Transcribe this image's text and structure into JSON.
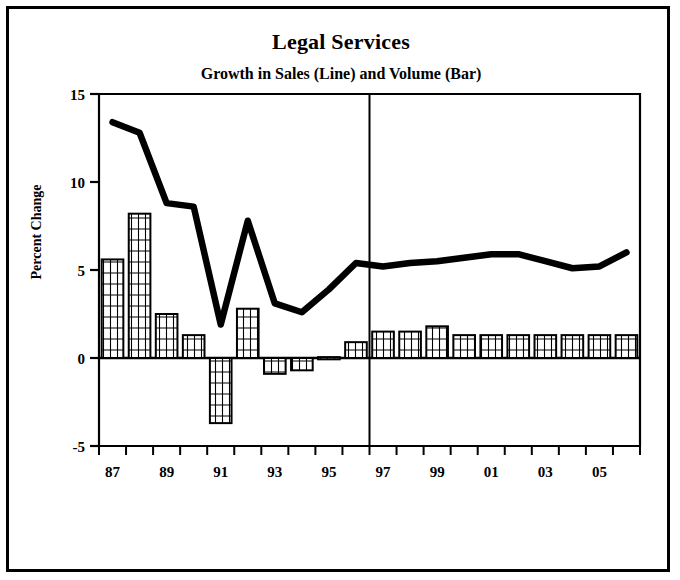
{
  "chart_data": {
    "type": "bar",
    "title": "Legal Services",
    "subtitle": "Growth in Sales (Line) and Volume (Bar)",
    "xlabel": "",
    "ylabel": "Percent Change",
    "ylim": [
      -5,
      15
    ],
    "yticks": [
      -5,
      0,
      5,
      10,
      15
    ],
    "ytick_labels": [
      "-5",
      "0",
      "5",
      "10",
      "15"
    ],
    "grid": false,
    "legend": "none",
    "categories": [
      "87",
      "88",
      "89",
      "90",
      "91",
      "92",
      "93",
      "94",
      "95",
      "96",
      "97",
      "98",
      "99",
      "00",
      "01",
      "02",
      "03",
      "04",
      "05",
      "06"
    ],
    "xtick_labels": [
      "87",
      "89",
      "91",
      "93",
      "95",
      "97",
      "99",
      "01",
      "03",
      "05"
    ],
    "series": [
      {
        "name": "Volume (Bar)",
        "type": "bar",
        "values": [
          5.6,
          8.2,
          2.5,
          1.3,
          -3.7,
          2.8,
          -0.9,
          -0.7,
          0.05,
          0.9,
          1.5,
          1.5,
          1.8,
          1.3,
          1.3,
          1.3,
          1.3,
          1.3,
          1.3,
          1.3
        ]
      },
      {
        "name": "Sales (Line)",
        "type": "line",
        "values": [
          13.4,
          12.8,
          8.8,
          8.6,
          1.9,
          7.8,
          3.1,
          2.6,
          3.9,
          5.4,
          5.2,
          5.4,
          5.5,
          5.7,
          5.9,
          5.9,
          5.5,
          5.1,
          5.2,
          6.0
        ]
      }
    ],
    "annotations": [
      {
        "name": "forecast-divider",
        "type": "vline",
        "at_category": "96",
        "note": "vertical line separating history from forecast"
      }
    ],
    "colors": {
      "line": "#000000",
      "bar_edge": "#000000",
      "bar_fill": "#ffffff",
      "axis": "#000000",
      "background": "#ffffff"
    }
  }
}
